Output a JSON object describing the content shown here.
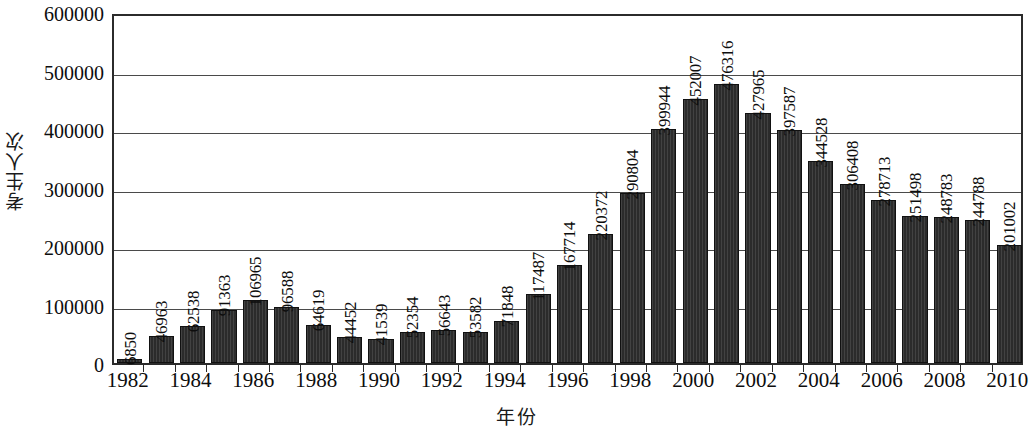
{
  "chart_data": {
    "type": "bar",
    "title": "",
    "xlabel": "年份",
    "ylabel": "考生人次",
    "ylim": [
      0,
      600000
    ],
    "ytick_values": [
      0,
      100000,
      200000,
      300000,
      400000,
      500000,
      600000
    ],
    "ytick_labels": [
      "0",
      "100000",
      "200000",
      "300000",
      "400000",
      "500000",
      "600000"
    ],
    "grid": true,
    "legend": null,
    "bar_color": "#2b2b2b",
    "axis_color": "#2b2b2b",
    "background": "#ffffff",
    "xtick_labels": [
      "1982",
      "1984",
      "1986",
      "1988",
      "1990",
      "1992",
      "1994",
      "1996",
      "1998",
      "2000",
      "2002",
      "2004",
      "2006",
      "2008",
      "2010"
    ],
    "categories": [
      "1982",
      "1983",
      "1984",
      "1985",
      "1986",
      "1987",
      "1988",
      "1989",
      "1990",
      "1991",
      "1992",
      "1993",
      "1994",
      "1995",
      "1996",
      "1997",
      "1998",
      "1999",
      "2000",
      "2001",
      "2002",
      "2003",
      "2004",
      "2005",
      "2006",
      "2007",
      "2008",
      "2009",
      "2010"
    ],
    "values": [
      6850,
      46963,
      62538,
      91363,
      106965,
      96588,
      64619,
      44452,
      41539,
      52354,
      56643,
      53582,
      71848,
      117487,
      167714,
      220372,
      290804,
      399944,
      452007,
      476316,
      427965,
      397587,
      344528,
      306408,
      278713,
      251498,
      248783,
      244788,
      201002
    ],
    "data_labels": [
      "6850",
      "46963",
      "62538",
      "91363",
      "106965",
      "96588",
      "64619",
      "44452",
      "41539",
      "52354",
      "56643",
      "53582",
      "71848",
      "117487",
      "167714",
      "220372",
      "290804",
      "399944",
      "452007",
      "476316",
      "427965",
      "397587",
      "344528",
      "306408",
      "278713",
      "251498",
      "248783",
      "244788",
      "201002"
    ]
  }
}
